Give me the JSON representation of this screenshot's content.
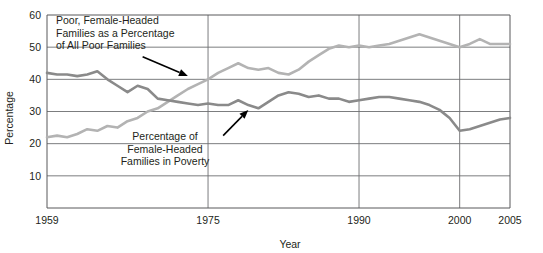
{
  "chart_data": {
    "type": "line",
    "title": "",
    "xlabel": "Year",
    "ylabel": "Percentage",
    "xlim": [
      1959,
      2005
    ],
    "ylim": [
      0,
      60
    ],
    "grid": true,
    "legend_position": "none",
    "y_ticks": [
      10,
      20,
      30,
      40,
      50,
      60
    ],
    "x_ticks": [
      1959,
      1975,
      1990,
      2000,
      2005
    ],
    "x_gridlines": [
      1975,
      1990,
      2000
    ],
    "annotations": [
      {
        "id": "annot-poor-female-headed-share",
        "lines": [
          "Poor, Female-Headed",
          "Families as a Percentage",
          "of All Poor Families"
        ],
        "arrow_from": [
          1968.5,
          47.0
        ],
        "arrow_to": [
          1973.0,
          41.0
        ]
      },
      {
        "id": "annot-female-headed-poverty-rate",
        "lines": [
          "Percentage of",
          "Female-Headed",
          "Families in Poverty"
        ],
        "arrow_from": [
          1976.5,
          22.5
        ],
        "arrow_to": [
          1979.0,
          30.5
        ]
      }
    ],
    "series": [
      {
        "name": "Poor, Female-Headed Families as a Percentage of All Poor Families",
        "color": "#b3b3b3",
        "x": [
          1959,
          1960,
          1961,
          1962,
          1963,
          1964,
          1965,
          1966,
          1967,
          1968,
          1969,
          1970,
          1971,
          1972,
          1973,
          1974,
          1975,
          1976,
          1977,
          1978,
          1979,
          1980,
          1981,
          1982,
          1983,
          1984,
          1985,
          1986,
          1987,
          1988,
          1989,
          1990,
          1991,
          1992,
          1993,
          1994,
          1995,
          1996,
          1997,
          1998,
          1999,
          2000,
          2001,
          2002,
          2003,
          2004,
          2005
        ],
        "values": [
          22.0,
          22.5,
          22.0,
          23.0,
          24.5,
          24.0,
          25.5,
          25.0,
          27.0,
          28.0,
          30.0,
          31.0,
          33.0,
          35.0,
          37.0,
          38.5,
          40.0,
          42.0,
          43.5,
          45.0,
          43.5,
          43.0,
          43.5,
          42.0,
          41.5,
          43.0,
          45.5,
          47.5,
          49.5,
          50.5,
          50.0,
          50.5,
          50.0,
          50.5,
          51.0,
          52.0,
          53.0,
          54.0,
          53.0,
          52.0,
          51.0,
          50.0,
          51.0,
          52.5,
          51.0,
          51.0,
          51.0
        ]
      },
      {
        "name": "Percentage of Female-Headed Families in Poverty",
        "color": "#8a8a8a",
        "x": [
          1959,
          1960,
          1961,
          1962,
          1963,
          1964,
          1965,
          1966,
          1967,
          1968,
          1969,
          1970,
          1971,
          1972,
          1973,
          1974,
          1975,
          1976,
          1977,
          1978,
          1979,
          1980,
          1981,
          1982,
          1983,
          1984,
          1985,
          1986,
          1987,
          1988,
          1989,
          1990,
          1991,
          1992,
          1993,
          1994,
          1995,
          1996,
          1997,
          1998,
          1999,
          2000,
          2001,
          2002,
          2003,
          2004,
          2005
        ],
        "values": [
          42.0,
          41.5,
          41.5,
          41.0,
          41.5,
          42.5,
          40.0,
          38.0,
          36.0,
          38.0,
          37.0,
          34.0,
          33.5,
          33.0,
          32.5,
          32.0,
          32.5,
          32.0,
          32.0,
          33.5,
          32.0,
          31.0,
          33.0,
          35.0,
          36.0,
          35.5,
          34.5,
          35.0,
          34.0,
          34.0,
          33.0,
          33.5,
          34.0,
          34.5,
          34.5,
          34.0,
          33.5,
          33.0,
          32.0,
          30.5,
          28.0,
          24.0,
          24.5,
          25.5,
          26.5,
          27.5,
          28.0
        ]
      }
    ]
  }
}
